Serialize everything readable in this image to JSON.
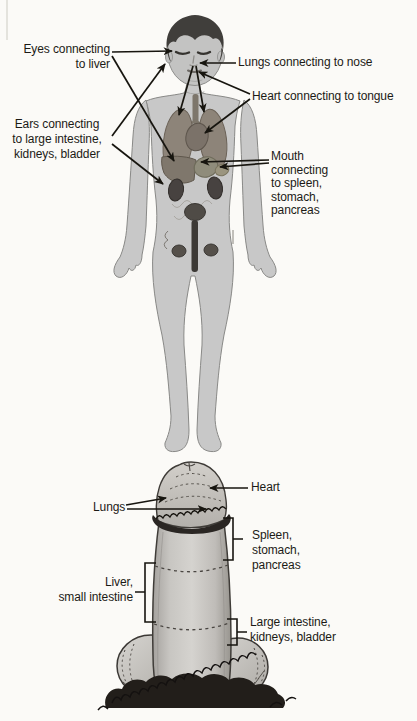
{
  "palette": {
    "paper": "#fbfaf7",
    "ink": "#17150f",
    "body_gray": "#c8c8c8",
    "organ_brown": "#8d8479",
    "organ_dark": "#474240"
  },
  "body_diagram": {
    "labels": {
      "eyes_liver": "Eyes connecting\nto liver",
      "lungs_nose": "Lungs connecting to nose",
      "heart_tongue": "Heart connecting to tongue",
      "ears_organs": "Ears connecting\nto large intestine,\nkidneys, bladder",
      "mouth_organs": "Mouth\nconnecting\nto spleen,\nstomach,\npancreas"
    }
  },
  "penis_diagram": {
    "labels": {
      "heart": "Heart",
      "lungs": "Lungs",
      "spleen_stomach_pancreas": "Spleen,\nstomach,\npancreas",
      "liver_small_intestine": "Liver,\nsmall intestine",
      "large_intestine_kidneys_bladder": "Large intestine,\nkidneys, bladder"
    }
  }
}
